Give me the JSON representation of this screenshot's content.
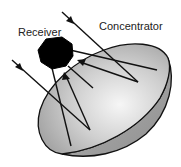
{
  "diagram": {
    "labels": {
      "receiver": "Receiver",
      "concentrator": "Concentrator"
    },
    "colors": {
      "background": "#ffffff",
      "line": "#111111",
      "receiver_fill": "#000000",
      "dish_inner_light": "#f2f2f2",
      "dish_inner_dark": "#a8a8a8",
      "dish_back": "#9e9e9e"
    },
    "components": [
      {
        "id": "receiver",
        "shape": "octagon-blob",
        "fill": "black"
      },
      {
        "id": "concentrator",
        "shape": "parabolic-dish",
        "fill": "gray-gradient"
      },
      {
        "id": "incoming-ray-1",
        "direction": "down-right",
        "has_arrow": true
      },
      {
        "id": "incoming-ray-2",
        "direction": "down-right",
        "has_arrow": true
      },
      {
        "id": "reflected-ray-1",
        "direction": "up-left to receiver",
        "has_arrow": true
      },
      {
        "id": "reflected-ray-2",
        "direction": "up to receiver",
        "has_arrow": true
      },
      {
        "id": "support-struts",
        "count": 3
      }
    ]
  }
}
